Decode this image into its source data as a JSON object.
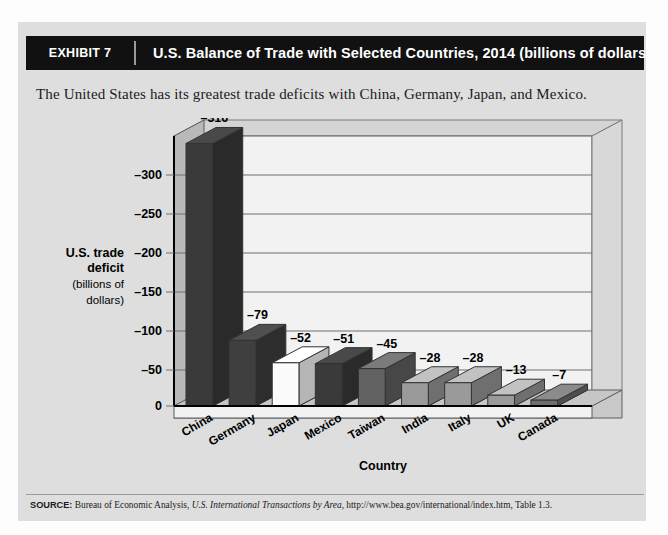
{
  "exhibit": {
    "tag": "EXHIBIT 7",
    "title": "U.S. Balance of Trade with Selected Countries, 2014 (billions of dollars)"
  },
  "caption": "The United States has its greatest trade deficits with China, Germany, Japan, and Mexico.",
  "source": {
    "label": "SOURCE:",
    "text_before": " Bureau of Economic Analysis, ",
    "italic": "U.S. International Transactions by Area",
    "text_after": ", http://www.bea.gov/international/index.htm, Table 1.3."
  },
  "axis": {
    "y_title_line1": "U.S. trade",
    "y_title_line2": "deficit",
    "y_title_line3": "(billions of",
    "y_title_line4": "dollars)",
    "x_title": "Country"
  },
  "colors": {
    "header_bg": "#111111",
    "header_text": "#ffffff",
    "page_bg": "#dedede",
    "plot_bg": "#f2f2f2",
    "wall_bg": "#bdbdbd",
    "floor_bg": "#c6c6c6",
    "gridline": "#6e6e6e",
    "axis": "#000000"
  },
  "chart_data": {
    "type": "bar",
    "title": "U.S. Balance of Trade with Selected Countries, 2014 (billions of dollars)",
    "xlabel": "Country",
    "ylabel": "U.S. trade deficit (billions of dollars)",
    "categories": [
      "China",
      "Germany",
      "Japan",
      "Mexico",
      "Taiwan",
      "India",
      "Italy",
      "UK",
      "Canada"
    ],
    "values": [
      -316,
      -79,
      -52,
      -51,
      -45,
      -28,
      -28,
      -13,
      -7
    ],
    "data_labels": [
      "–316",
      "–79",
      "–52",
      "–51",
      "–45",
      "–28",
      "–28",
      "–13",
      "–7"
    ],
    "bar_colors": [
      "#3a3a3a",
      "#3f3f3f",
      "#fbfbfb",
      "#3a3a3a",
      "#626262",
      "#9a9a9a",
      "#9a9a9a",
      "#9a9a9a",
      "#6e6e6e"
    ],
    "ytick_labels": [
      "–300",
      "–250",
      "–200",
      "–150",
      "–100",
      "–50",
      "0"
    ],
    "ytick_values": [
      -300,
      -250,
      -200,
      -150,
      -100,
      -50,
      0
    ],
    "ylim": [
      -325,
      0
    ],
    "grid": true,
    "legend": "none",
    "note": "Values are negative (deficits); axis is inverted so larger deficits extend upward."
  }
}
